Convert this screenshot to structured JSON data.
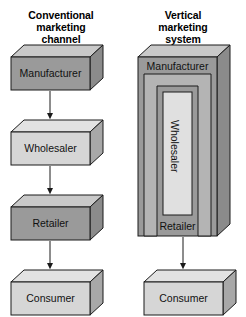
{
  "diagram": {
    "title_left": "Conventional\nmarketing\nchannel",
    "title_right": "Vertical\nmarketing\nsystem",
    "colors": {
      "fill_dark": "#9a9a9a",
      "fill_light": "#d6d6d6",
      "fill_mid": "#b4b4b4",
      "top_face": "#c9c9c9",
      "side_face": "#8b8b8b",
      "outline": "#1a1a1a",
      "arrow": "#1a1a1a",
      "background": "#ffffff"
    },
    "left_column": {
      "name": "Conventional marketing channel",
      "nodes": [
        {
          "label": "Manufacturer",
          "shade": "dark"
        },
        {
          "label": "Wholesaler",
          "shade": "light"
        },
        {
          "label": "Retailer",
          "shade": "dark"
        },
        {
          "label": "Consumer",
          "shade": "light"
        }
      ],
      "connectors": [
        {
          "from": "Manufacturer",
          "to": "Wholesaler",
          "type": "arrow-down"
        },
        {
          "from": "Wholesaler",
          "to": "Retailer",
          "type": "arrow-down"
        },
        {
          "from": "Retailer",
          "to": "Consumer",
          "type": "arrow-down"
        }
      ]
    },
    "right_column": {
      "name": "Vertical marketing system",
      "outer_node": {
        "label_top": "Manufacturer",
        "label_bottom": "Retailer",
        "shade": "dark"
      },
      "nested_nodes": [
        {
          "label": "",
          "shade": "mid"
        },
        {
          "label": "Wholesaler",
          "shade": "light",
          "orientation": "vertical"
        }
      ],
      "nodes": [
        {
          "label": "Consumer",
          "shade": "light"
        }
      ],
      "connectors": [
        {
          "from": "Retailer",
          "to": "Consumer",
          "type": "arrow-down"
        }
      ]
    }
  }
}
